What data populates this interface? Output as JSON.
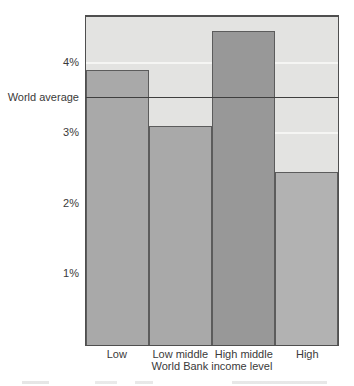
{
  "chart_data": {
    "type": "bar",
    "title": "",
    "categories": [
      "Low",
      "Low middle",
      "High middle",
      "High"
    ],
    "values": [
      3.9,
      3.1,
      4.45,
      2.45
    ],
    "unit": "%",
    "xlabel": "World Bank income level",
    "ylabel": "",
    "yticks": [
      {
        "value": 1,
        "label": "1%"
      },
      {
        "value": 2,
        "label": "2%"
      },
      {
        "value": 3,
        "label": "3%"
      },
      {
        "value": 4,
        "label": "4%"
      }
    ],
    "ylim": [
      0,
      4.65
    ],
    "reference_line": {
      "label": "World average",
      "value": 3.5
    },
    "legend": "none",
    "grid": "horizontal white gridlines at each tick, drawn behind bars",
    "bar_colors": [
      "#a9a9a9",
      "#a9a9a9",
      "#989898",
      "#b2b2b2"
    ],
    "plot_background": "#e3e3e1",
    "plot_border_color": "#4f4f4f",
    "gridline_color": "#f5f5f3",
    "reference_line_color": "#3f3f3f",
    "text_color": "#3a3a3a"
  }
}
